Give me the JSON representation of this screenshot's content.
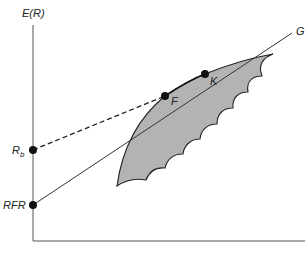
{
  "diagram": {
    "axes": {
      "y_label": "E(R)",
      "x_label": ""
    },
    "points": [
      {
        "id": "rb",
        "label": "R",
        "label_sub": "b"
      },
      {
        "id": "rfr",
        "label": "RFR"
      },
      {
        "id": "f",
        "label": "F"
      },
      {
        "id": "k",
        "label": "K"
      }
    ],
    "lines": [
      {
        "id": "rfr-g",
        "from": "RFR",
        "to": "G",
        "style": "solid",
        "end_label": "G"
      },
      {
        "id": "rb-k",
        "from": "R_b",
        "to": "K",
        "style": "dashed"
      }
    ],
    "region": {
      "name": "feasible-set",
      "fill": "#b3b3b3",
      "stroke": "#222222"
    },
    "colors": {
      "axis": "#555555",
      "line": "#333333",
      "point": "#111111",
      "region_fill": "#b3b3b3"
    }
  }
}
